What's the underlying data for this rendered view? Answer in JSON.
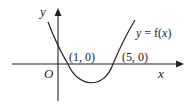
{
  "diagram": {
    "type": "function-graph",
    "axes": {
      "x_label": "x",
      "y_label": "y",
      "origin_label": "O"
    },
    "curve": {
      "label": "y = f(x)",
      "label_parts": [
        "y",
        " = f(",
        "x",
        ")"
      ],
      "shape": "upward parabola"
    },
    "points": [
      {
        "label": "(1, 0)",
        "x": 1,
        "y": 0
      },
      {
        "label": "(5, 0)",
        "x": 5,
        "y": 0
      }
    ],
    "colors": {
      "stroke": "#222222",
      "background": "#ffffff"
    }
  }
}
